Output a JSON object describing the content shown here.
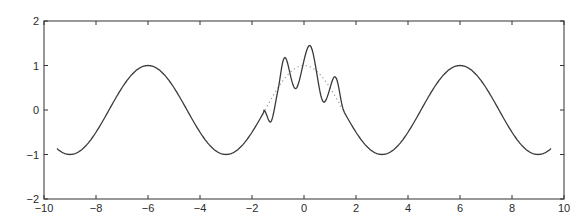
{
  "chart_data": {
    "type": "line",
    "title": "",
    "xlabel": "",
    "ylabel": "",
    "xlim": [
      -10,
      10
    ],
    "ylim": [
      -2,
      2
    ],
    "grid": false,
    "legend": null,
    "xticks": [
      -10,
      -8,
      -6,
      -4,
      -2,
      0,
      2,
      4,
      6,
      8,
      10
    ],
    "yticks": [
      -2,
      -1,
      0,
      1,
      2
    ],
    "series": [
      {
        "name": "solid",
        "style": "solid",
        "color": "#3a3a3a",
        "description": "cos(pi*x/3) on [-9.5, 9.5] with oscillatory perturbation on [-1.5, 1.5]",
        "base_function": "cos(pi*x/3)",
        "domain": [
          -9.5,
          9.5
        ],
        "perturbed_interval": [
          -1.5,
          1.5
        ],
        "perturbed_points": [
          [
            -1.54,
            -0.01
          ],
          [
            -1.27,
            -0.26
          ],
          [
            -1.0,
            0.45
          ],
          [
            -0.73,
            1.18
          ],
          [
            -0.31,
            0.48
          ],
          [
            0.23,
            1.45
          ],
          [
            0.73,
            0.19
          ],
          [
            1.19,
            0.75
          ],
          [
            1.5,
            0.03
          ]
        ],
        "extrema": {
          "maxima": [
            [
              -6,
              1
            ],
            [
              -0.73,
              1.18
            ],
            [
              0.23,
              1.45
            ],
            [
              1.19,
              0.75
            ],
            [
              6,
              1
            ]
          ],
          "minima": [
            [
              -9,
              -1
            ],
            [
              -3,
              -1
            ],
            [
              -0.31,
              0.48
            ],
            [
              0.73,
              0.19
            ],
            [
              3,
              -1
            ],
            [
              9,
              -1
            ]
          ]
        }
      },
      {
        "name": "dotted",
        "style": "dotted",
        "color": "#9a9a9a",
        "description": "cos(pi*x/3) on [-1.5, 1.5]",
        "base_function": "cos(pi*x/3)",
        "domain": [
          -1.5,
          1.5
        ]
      }
    ]
  },
  "layout": {
    "plot_left": 44,
    "plot_top": 21,
    "plot_right": 564,
    "plot_bottom": 199
  }
}
